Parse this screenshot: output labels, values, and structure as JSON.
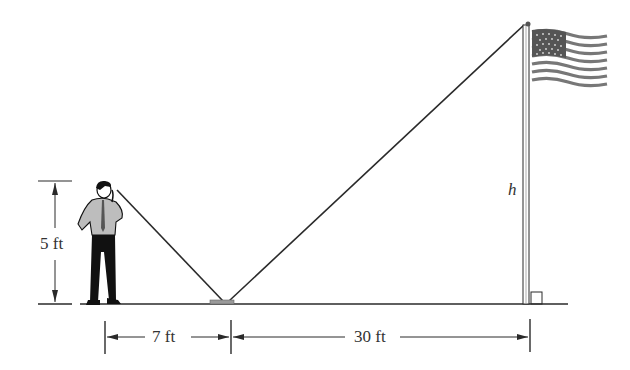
{
  "diagram": {
    "labels": {
      "person_height": "5 ft",
      "person_to_mirror": "7 ft",
      "mirror_to_pole": "30 ft",
      "pole_height": "h"
    },
    "colors": {
      "line": "#2a2a2a",
      "shirt": "#bdbdbd",
      "pants": "#111111",
      "flag_stripe": "#777777",
      "flag_canton": "#555555",
      "mirror": "#9a9a9a",
      "text": "#333333"
    },
    "elements": [
      "person",
      "mirror",
      "flagpole",
      "flag",
      "ground",
      "sight-lines",
      "dimension-lines",
      "right-angle-marker"
    ]
  }
}
